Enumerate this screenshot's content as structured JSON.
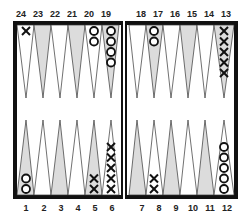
{
  "board": {
    "top_numbers": [
      "24",
      "23",
      "22",
      "21",
      "20",
      "19",
      "18",
      "17",
      "16",
      "15",
      "14",
      "13"
    ],
    "bottom_numbers": [
      "1",
      "2",
      "3",
      "4",
      "5",
      "6",
      "7",
      "8",
      "9",
      "10",
      "11",
      "12"
    ],
    "colors": {
      "frame": "#111111",
      "shaded_point": "#dcdcdc",
      "light_point": "#ffffff",
      "checker_stroke": "#111111"
    },
    "points": [
      {
        "point": 24,
        "player": "X",
        "count": 1
      },
      {
        "point": 20,
        "player": "O",
        "count": 2
      },
      {
        "point": 19,
        "player": "O",
        "count": 4
      },
      {
        "point": 17,
        "player": "O",
        "count": 2
      },
      {
        "point": 13,
        "player": "X",
        "count": 5
      },
      {
        "point": 1,
        "player": "O",
        "count": 2
      },
      {
        "point": 5,
        "player": "X",
        "count": 2
      },
      {
        "point": 6,
        "player": "X",
        "count": 5
      },
      {
        "point": 8,
        "player": "X",
        "count": 2
      },
      {
        "point": 12,
        "player": "O",
        "count": 5
      }
    ]
  }
}
